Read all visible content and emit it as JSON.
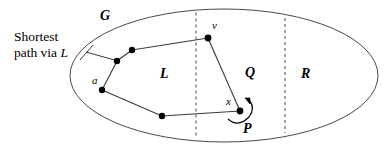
{
  "figure": {
    "title_hidden": "",
    "callout": {
      "line1": "Shortest",
      "line2_prefix": "path via ",
      "line2_italic": "L"
    },
    "labels": {
      "graph": "G",
      "region_left": "L",
      "region_middle": "Q",
      "region_right": "R",
      "vertex_v": "v",
      "vertex_a": "a",
      "vertex_x": "x",
      "path_p": "P"
    },
    "colors": {
      "stroke": "#3a3a3a",
      "node_fill": "#000000",
      "text": "#000000",
      "background": "#ffffff"
    },
    "geometry": {
      "ellipse": {
        "cx": 224,
        "cy": 75.5,
        "rx": 154,
        "ry": 66.5
      },
      "divider_1_x": 196,
      "divider_2_x": 285,
      "nodes": [
        {
          "name": "a",
          "x": 102,
          "y": 90
        },
        {
          "name": "n1",
          "x": 117,
          "y": 61
        },
        {
          "name": "n2",
          "x": 132,
          "y": 50
        },
        {
          "name": "v",
          "x": 208,
          "y": 38
        },
        {
          "name": "x",
          "x": 240,
          "y": 111
        },
        {
          "name": "n3",
          "x": 162,
          "y": 116
        }
      ],
      "edges": [
        [
          "a",
          "n1"
        ],
        [
          "n1",
          "n2"
        ],
        [
          "n2",
          "v"
        ],
        [
          "v",
          "x"
        ],
        [
          "x",
          "n3"
        ],
        [
          "n3",
          "a"
        ]
      ],
      "leader_line": {
        "x1": 88,
        "y1": 53,
        "x2": 117,
        "y2": 61
      }
    }
  }
}
